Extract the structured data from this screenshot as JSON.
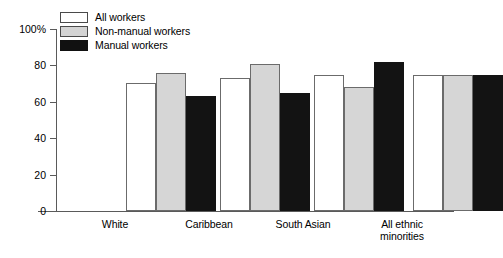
{
  "chart_data": {
    "type": "bar",
    "title": "",
    "xlabel": "",
    "ylabel": "",
    "ylim": [
      0,
      100
    ],
    "yticks": [
      0,
      20,
      40,
      60,
      80,
      100
    ],
    "ytick_labels": [
      "0",
      "20",
      "40",
      "60",
      "80",
      "100%"
    ],
    "grid": false,
    "legend_position": "top-left",
    "categories": [
      "White",
      "Caribbean",
      "South Asian",
      "All ethnic\nminorities"
    ],
    "series": [
      {
        "name": "All workers",
        "color": "#ffffff",
        "values": [
          70.5,
          73,
          74.5,
          74.5
        ]
      },
      {
        "name": "Non-manual workers",
        "color": "#d6d6d6",
        "values": [
          76,
          81,
          68,
          74.5
        ]
      },
      {
        "name": "Manual workers",
        "color": "#131313",
        "values": [
          63,
          65,
          82,
          74.5
        ]
      }
    ]
  },
  "legend": {
    "items": [
      {
        "label": "All workers",
        "swatch": "white-swatch"
      },
      {
        "label": "Non-manual workers",
        "swatch": "light-gray-swatch"
      },
      {
        "label": "Manual workers",
        "swatch": "black-swatch"
      }
    ]
  },
  "axis": {
    "y_labels": [
      "100%",
      "80",
      "60",
      "40",
      "20",
      "0"
    ]
  },
  "categories": {
    "white": "White",
    "caribbean": "Caribbean",
    "south_asian": "South Asian",
    "all_ethnic_minorities_line1": "All ethnic",
    "all_ethnic_minorities_line2": "minorities"
  }
}
